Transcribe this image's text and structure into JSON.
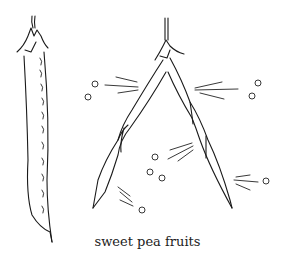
{
  "figure": {
    "caption": "sweet pea fruits",
    "elements": [
      {
        "name": "closed-pod",
        "description": "single closed sweet pea pod with visible seeds"
      },
      {
        "name": "split-pod",
        "description": "dehiscent pod twisted open into two valves"
      },
      {
        "name": "scattered-seeds",
        "count": 9
      }
    ],
    "colors": {
      "line": "#1a1a1a",
      "background": "#ffffff"
    }
  }
}
